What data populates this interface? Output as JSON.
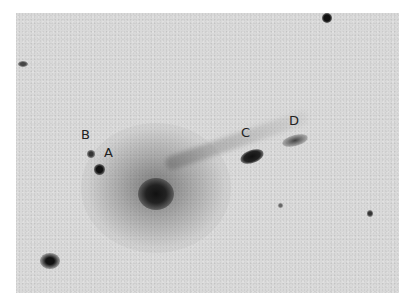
{
  "image": {
    "description": "Grayscale astronomical plate of a galaxy with a faint tail and labeled knots",
    "background_color": "#d9d9d9"
  },
  "labels": [
    {
      "id": "A",
      "text": "A"
    },
    {
      "id": "B",
      "text": "B"
    },
    {
      "id": "C",
      "text": "C"
    },
    {
      "id": "D",
      "text": "D"
    }
  ]
}
